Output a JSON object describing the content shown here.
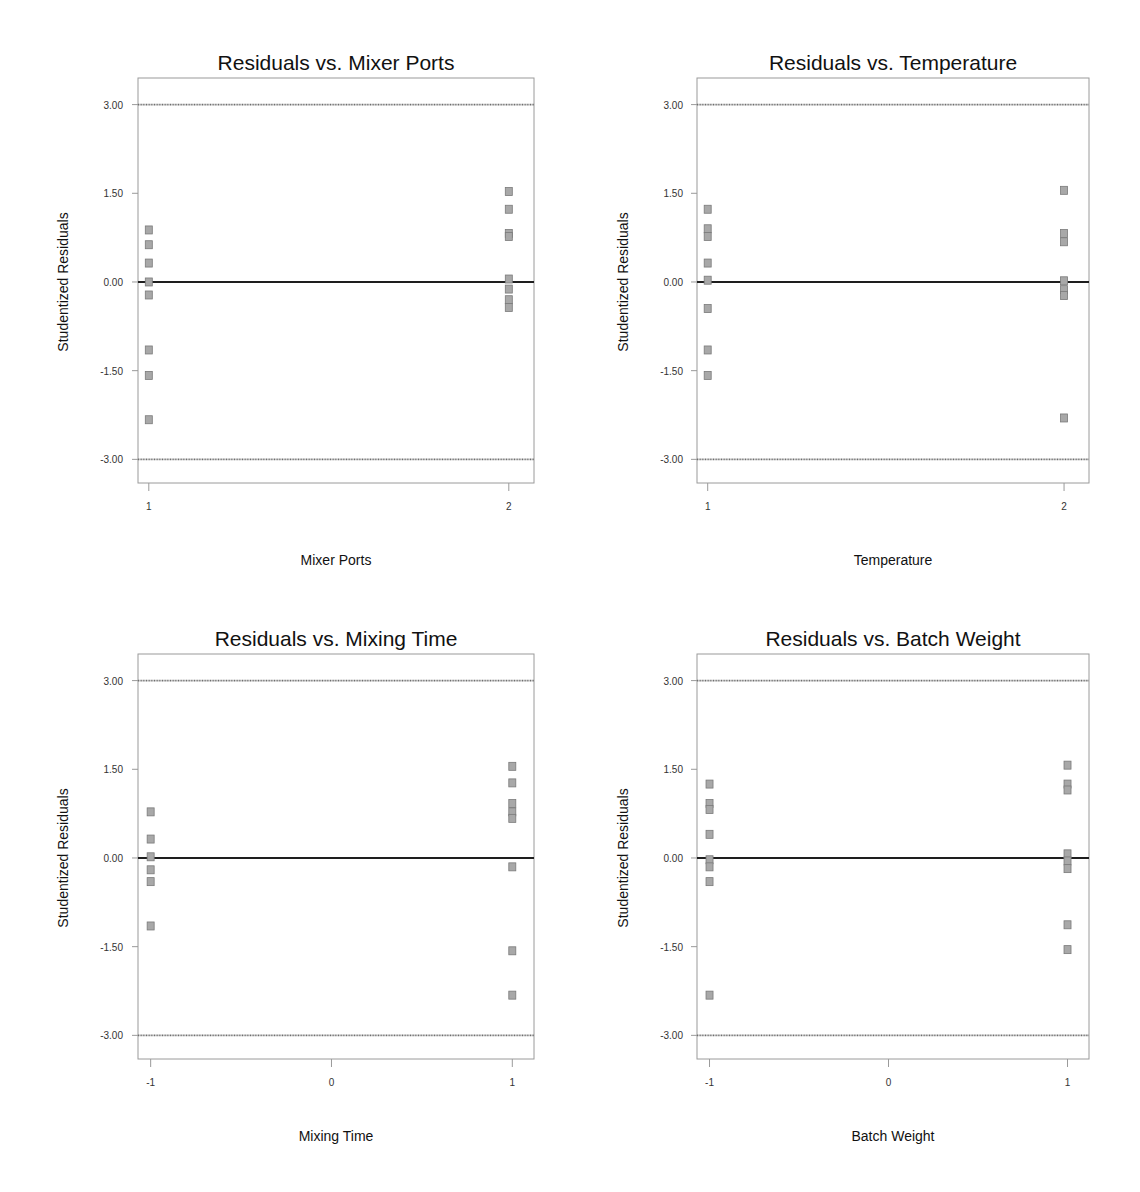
{
  "chart_data": [
    {
      "type": "scatter",
      "title": "Residuals vs. Mixer Ports",
      "xlabel": "Mixer Ports",
      "ylabel": "Studentized Residuals",
      "x_ticks": [
        "1",
        "2"
      ],
      "x_tick_values": [
        1,
        2
      ],
      "xlim": [
        0.97,
        2.07
      ],
      "y_ticks": [
        "3.00",
        "1.50",
        "0.00",
        "-1.50",
        "-3.00"
      ],
      "ylim": [
        -3.4,
        3.45
      ],
      "reference_lines": [
        3.0,
        0.0,
        -3.0
      ],
      "points": [
        {
          "x": 1,
          "y": 0.88
        },
        {
          "x": 1,
          "y": 0.63
        },
        {
          "x": 1,
          "y": 0.32
        },
        {
          "x": 1,
          "y": 0.0
        },
        {
          "x": 1,
          "y": -0.22
        },
        {
          "x": 1,
          "y": -1.15
        },
        {
          "x": 1,
          "y": -1.58
        },
        {
          "x": 1,
          "y": -2.33
        },
        {
          "x": 2,
          "y": 1.53
        },
        {
          "x": 2,
          "y": 1.23
        },
        {
          "x": 2,
          "y": 0.82
        },
        {
          "x": 2,
          "y": 0.77
        },
        {
          "x": 2,
          "y": 0.05
        },
        {
          "x": 2,
          "y": -0.12
        },
        {
          "x": 2,
          "y": -0.3
        },
        {
          "x": 2,
          "y": -0.43
        }
      ]
    },
    {
      "type": "scatter",
      "title": "Residuals vs. Temperature",
      "xlabel": "Temperature",
      "ylabel": "Studentized Residuals",
      "x_ticks": [
        "1",
        "2"
      ],
      "x_tick_values": [
        1,
        2
      ],
      "xlim": [
        0.97,
        2.07
      ],
      "y_ticks": [
        "3.00",
        "1.50",
        "0.00",
        "-1.50",
        "-3.00"
      ],
      "ylim": [
        -3.4,
        3.45
      ],
      "reference_lines": [
        3.0,
        0.0,
        -3.0
      ],
      "points": [
        {
          "x": 1,
          "y": 1.23
        },
        {
          "x": 1,
          "y": 0.9
        },
        {
          "x": 1,
          "y": 0.77
        },
        {
          "x": 1,
          "y": 0.32
        },
        {
          "x": 1,
          "y": 0.03
        },
        {
          "x": 1,
          "y": -0.45
        },
        {
          "x": 1,
          "y": -1.15
        },
        {
          "x": 1,
          "y": -1.58
        },
        {
          "x": 2,
          "y": 1.55
        },
        {
          "x": 2,
          "y": 0.82
        },
        {
          "x": 2,
          "y": 0.68
        },
        {
          "x": 2,
          "y": 0.02
        },
        {
          "x": 2,
          "y": -0.13
        },
        {
          "x": 2,
          "y": -0.23
        },
        {
          "x": 2,
          "y": -2.3
        }
      ]
    },
    {
      "type": "scatter",
      "title": "Residuals vs. Mixing Time",
      "xlabel": "Mixing Time",
      "ylabel": "Studentized Residuals",
      "x_ticks": [
        "-1",
        "0",
        "1"
      ],
      "x_tick_values": [
        -1,
        0,
        1
      ],
      "xlim": [
        -1.07,
        1.12
      ],
      "y_ticks": [
        "3.00",
        "1.50",
        "0.00",
        "-1.50",
        "-3.00"
      ],
      "ylim": [
        -3.4,
        3.45
      ],
      "reference_lines": [
        3.0,
        0.0,
        -3.0
      ],
      "points": [
        {
          "x": -1,
          "y": 0.78
        },
        {
          "x": -1,
          "y": 0.32
        },
        {
          "x": -1,
          "y": 0.02
        },
        {
          "x": -1,
          "y": -0.2
        },
        {
          "x": -1,
          "y": -0.4
        },
        {
          "x": -1,
          "y": -1.15
        },
        {
          "x": 1,
          "y": 1.55
        },
        {
          "x": 1,
          "y": 1.27
        },
        {
          "x": 1,
          "y": 0.92
        },
        {
          "x": 1,
          "y": 0.78
        },
        {
          "x": 1,
          "y": 0.67
        },
        {
          "x": 1,
          "y": -0.15
        },
        {
          "x": 1,
          "y": -1.57
        },
        {
          "x": 1,
          "y": -2.32
        }
      ]
    },
    {
      "type": "scatter",
      "title": "Residuals vs. Batch Weight",
      "xlabel": "Batch Weight",
      "ylabel": "Studentized Residuals",
      "x_ticks": [
        "-1",
        "0",
        "1"
      ],
      "x_tick_values": [
        -1,
        0,
        1
      ],
      "xlim": [
        -1.07,
        1.12
      ],
      "y_ticks": [
        "3.00",
        "1.50",
        "0.00",
        "-1.50",
        "-3.00"
      ],
      "ylim": [
        -3.4,
        3.45
      ],
      "reference_lines": [
        3.0,
        0.0,
        -3.0
      ],
      "points": [
        {
          "x": -1,
          "y": 1.25
        },
        {
          "x": -1,
          "y": 0.92
        },
        {
          "x": -1,
          "y": 0.82
        },
        {
          "x": -1,
          "y": 0.4
        },
        {
          "x": -1,
          "y": -0.03
        },
        {
          "x": -1,
          "y": -0.15
        },
        {
          "x": -1,
          "y": -0.4
        },
        {
          "x": -1,
          "y": -2.32
        },
        {
          "x": 1,
          "y": 1.57
        },
        {
          "x": 1,
          "y": 1.25
        },
        {
          "x": 1,
          "y": 1.15
        },
        {
          "x": 1,
          "y": 0.07
        },
        {
          "x": 1,
          "y": -0.05
        },
        {
          "x": 1,
          "y": -0.18
        },
        {
          "x": 1,
          "y": -1.13
        },
        {
          "x": 1,
          "y": -1.55
        }
      ]
    }
  ],
  "layout": [
    {
      "left": 138,
      "top": 78,
      "width": 396,
      "height": 405,
      "title_y": 70,
      "xtick_y": 510,
      "xlabel_y": 565,
      "ylabel_x": 68,
      "ytick_x": 123
    },
    {
      "left": 697,
      "top": 78,
      "width": 392,
      "height": 405,
      "title_y": 70,
      "xtick_y": 510,
      "xlabel_y": 565,
      "ylabel_x": 628,
      "ytick_x": 683
    },
    {
      "left": 138,
      "top": 654,
      "width": 396,
      "height": 405,
      "title_y": 646,
      "xtick_y": 1086,
      "xlabel_y": 1141,
      "ylabel_x": 68,
      "ytick_x": 123
    },
    {
      "left": 697,
      "top": 654,
      "width": 392,
      "height": 405,
      "title_y": 646,
      "xtick_y": 1086,
      "xlabel_y": 1141,
      "ylabel_x": 628,
      "ytick_x": 683
    }
  ],
  "colors": {
    "frame": "#9a9a9a",
    "limit_line": "#6e6e6e",
    "zero_line": "#1e1e1e",
    "marker_fill": "#a8a8a8",
    "marker_stroke": "#7a7a7a",
    "text": "#111111",
    "tick_text": "#333333"
  }
}
